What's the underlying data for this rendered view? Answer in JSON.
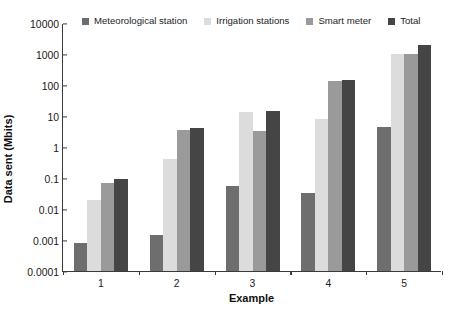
{
  "chart_data": {
    "type": "bar",
    "title": "",
    "xlabel": "Example",
    "ylabel": "Data sent (Mbits)",
    "yscale": "log",
    "ylim": [
      0.0001,
      10000
    ],
    "ytick_labels": [
      "10000",
      "1000",
      "100",
      "10",
      "1",
      "0.1",
      "0.01",
      "0.001",
      "0.0001"
    ],
    "ytick_values": [
      10000,
      1000,
      100,
      10,
      1,
      0.1,
      0.01,
      0.001,
      0.0001
    ],
    "categories": [
      "1",
      "2",
      "3",
      "4",
      "5"
    ],
    "grid": false,
    "legend_position": "top",
    "series": [
      {
        "name": "Meteorological station",
        "color": "#6e6e6e",
        "values": [
          0.0008,
          0.0015,
          0.055,
          0.033,
          4.5
        ]
      },
      {
        "name": "Irrigation stations",
        "color": "#dcdcdc",
        "values": [
          0.02,
          0.4,
          13,
          8,
          1000
        ]
      },
      {
        "name": "Smart meter",
        "color": "#9a9a9a",
        "values": [
          0.07,
          3.5,
          3.2,
          130,
          1000
        ]
      },
      {
        "name": "Total",
        "color": "#454545",
        "values": [
          0.09,
          4.2,
          15,
          140,
          2000
        ]
      }
    ]
  },
  "axis": {
    "color": "#3a3a3a"
  }
}
